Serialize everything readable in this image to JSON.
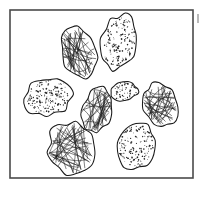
{
  "figure": {
    "background_color": "#ffffff",
    "frame": {
      "label": "frame-border",
      "x": 10,
      "y": 10,
      "width": 183,
      "height": 168,
      "stroke_color": "#4a4a4a",
      "stroke_width": 1.6,
      "fill_color": "#ffffff"
    },
    "ink_color": "#1a1a1a",
    "speckle_color": "#262626",
    "scribble_color": "#1d1d1d",
    "edge_artifact": {
      "label": "scan-edge-mark",
      "x": 197,
      "y": 14,
      "width": 2,
      "height": 9,
      "color": "#b9b9b9"
    },
    "texture_types": [
      "speckled",
      "scribbled"
    ],
    "stone_count": 8,
    "speckled_count": 4,
    "scribbled_count": 4,
    "stones": [
      {
        "id": "stone-1",
        "label": "scribbled-stone-upper-left",
        "texture": "scribbled",
        "cx": 78,
        "cy": 52,
        "rx": 17,
        "ry": 26,
        "rotation": -16,
        "scribble_strokes": 26,
        "speck_count": 0
      },
      {
        "id": "stone-2",
        "label": "speckled-stone-top-right",
        "texture": "speckled",
        "cx": 119,
        "cy": 42,
        "rx": 17,
        "ry": 27,
        "rotation": 12,
        "scribble_strokes": 0,
        "speck_count": 150
      },
      {
        "id": "stone-3",
        "label": "speckled-stone-left",
        "texture": "speckled",
        "cx": 48,
        "cy": 97,
        "rx": 24,
        "ry": 19,
        "rotation": -24,
        "scribble_strokes": 0,
        "speck_count": 165
      },
      {
        "id": "stone-4",
        "label": "scribbled-stone-center",
        "texture": "scribbled",
        "cx": 97,
        "cy": 110,
        "rx": 15,
        "ry": 23,
        "rotation": 16,
        "scribble_strokes": 24,
        "speck_count": 0
      },
      {
        "id": "stone-5",
        "label": "speckled-stone-small-center-right",
        "texture": "speckled",
        "cx": 124,
        "cy": 91,
        "rx": 14,
        "ry": 10,
        "rotation": -7,
        "scribble_strokes": 0,
        "speck_count": 52
      },
      {
        "id": "stone-6",
        "label": "scribbled-stone-right",
        "texture": "scribbled",
        "cx": 160,
        "cy": 104,
        "rx": 16,
        "ry": 22,
        "rotation": -20,
        "scribble_strokes": 26,
        "speck_count": 0
      },
      {
        "id": "stone-7",
        "label": "scribbled-stone-bottom-left",
        "texture": "scribbled",
        "cx": 71,
        "cy": 148,
        "rx": 23,
        "ry": 26,
        "rotation": -10,
        "scribble_strokes": 34,
        "speck_count": 0
      },
      {
        "id": "stone-8",
        "label": "speckled-stone-bottom-right",
        "texture": "speckled",
        "cx": 136,
        "cy": 146,
        "rx": 19,
        "ry": 23,
        "rotation": 10,
        "scribble_strokes": 0,
        "speck_count": 140
      }
    ]
  }
}
